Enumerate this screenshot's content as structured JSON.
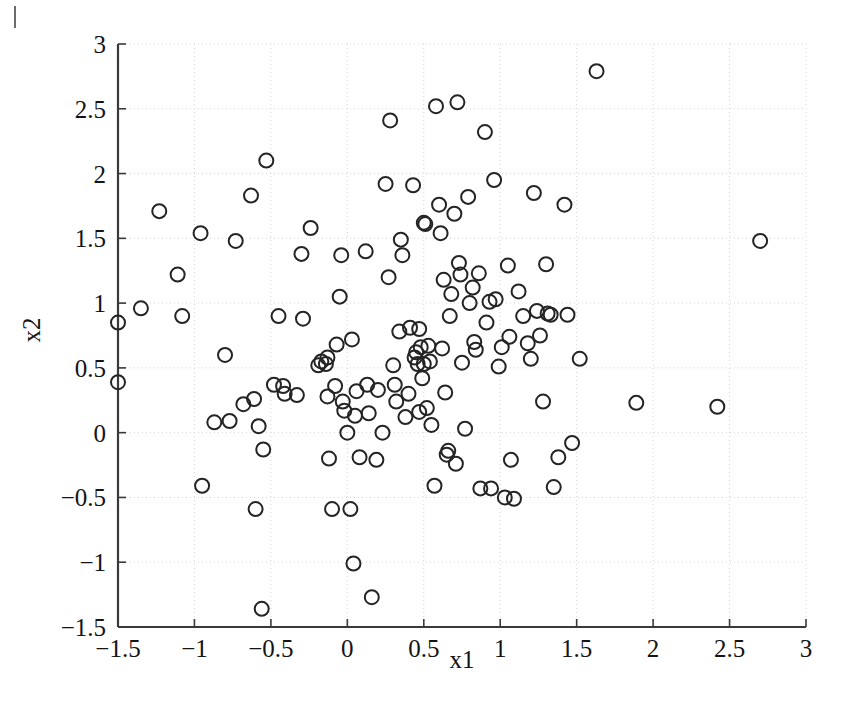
{
  "figure": {
    "kind": "scatter-plot",
    "background_color": "#ffffff",
    "marker_color": "#242424",
    "axis_color": "#3a3a3a",
    "grid_color": "#d6d6d6"
  },
  "chart_data": {
    "type": "scatter",
    "title": "",
    "subtitle": "",
    "xlabel": "x1",
    "ylabel": "x2",
    "xlim": [
      -1.5,
      3
    ],
    "ylim": [
      -1.5,
      3
    ],
    "xticks": [
      -1.5,
      -1,
      -0.5,
      0,
      0.5,
      1,
      1.5,
      2,
      2.5,
      3
    ],
    "yticks": [
      -1.5,
      -1,
      -0.5,
      0,
      0.5,
      1,
      1.5,
      2,
      2.5,
      3
    ],
    "xtick_labels": [
      "-1.5",
      "-1",
      "-0.5",
      "0",
      "0.5",
      "1",
      "1.5",
      "2",
      "2.5",
      "3"
    ],
    "ytick_labels": [
      "-1.5",
      "-1",
      "-0.5",
      "0",
      "0.5",
      "1",
      "1.5",
      "2",
      "2.5",
      "3"
    ],
    "grid": true,
    "grid_style": "dotted",
    "legend": null,
    "legend_position": "none",
    "marker": "open-circle",
    "marker_size": 7,
    "n_points": 139,
    "series": [
      {
        "name": "data",
        "points": [
          [
            -1.5,
            0.85
          ],
          [
            -1.5,
            0.39
          ],
          [
            -1.35,
            0.96
          ],
          [
            -1.23,
            1.71
          ],
          [
            -1.11,
            1.22
          ],
          [
            -1.08,
            0.9
          ],
          [
            -0.96,
            1.54
          ],
          [
            -0.95,
            -0.41
          ],
          [
            -0.87,
            0.08
          ],
          [
            -0.8,
            0.6
          ],
          [
            -0.77,
            0.09
          ],
          [
            -0.73,
            1.48
          ],
          [
            -0.68,
            0.22
          ],
          [
            -0.63,
            1.83
          ],
          [
            -0.61,
            0.26
          ],
          [
            -0.6,
            -0.59
          ],
          [
            -0.58,
            0.05
          ],
          [
            -0.56,
            -1.36
          ],
          [
            -0.55,
            -0.13
          ],
          [
            -0.53,
            2.1
          ],
          [
            -0.48,
            0.37
          ],
          [
            -0.45,
            0.9
          ],
          [
            -0.42,
            0.36
          ],
          [
            -0.41,
            0.3
          ],
          [
            -0.33,
            0.29
          ],
          [
            -0.3,
            1.38
          ],
          [
            -0.29,
            0.88
          ],
          [
            -0.24,
            1.58
          ],
          [
            -0.19,
            0.52
          ],
          [
            -0.17,
            0.55
          ],
          [
            -0.14,
            0.53
          ],
          [
            -0.13,
            0.58
          ],
          [
            -0.13,
            0.28
          ],
          [
            -0.12,
            -0.2
          ],
          [
            -0.1,
            -0.59
          ],
          [
            -0.08,
            0.36
          ],
          [
            -0.07,
            0.68
          ],
          [
            -0.05,
            1.05
          ],
          [
            -0.04,
            1.37
          ],
          [
            -0.03,
            0.24
          ],
          [
            -0.02,
            0.17
          ],
          [
            0.0,
            0.0
          ],
          [
            0.02,
            -0.59
          ],
          [
            0.03,
            0.72
          ],
          [
            0.04,
            -1.01
          ],
          [
            0.05,
            0.13
          ],
          [
            0.06,
            0.32
          ],
          [
            0.08,
            -0.19
          ],
          [
            0.12,
            1.4
          ],
          [
            0.13,
            0.37
          ],
          [
            0.14,
            0.15
          ],
          [
            0.16,
            -1.27
          ],
          [
            0.19,
            -0.21
          ],
          [
            0.2,
            0.33
          ],
          [
            0.23,
            0.0
          ],
          [
            0.25,
            1.92
          ],
          [
            0.27,
            1.2
          ],
          [
            0.28,
            2.41
          ],
          [
            0.3,
            0.52
          ],
          [
            0.31,
            0.37
          ],
          [
            0.32,
            0.24
          ],
          [
            0.34,
            0.78
          ],
          [
            0.35,
            1.49
          ],
          [
            0.36,
            1.37
          ],
          [
            0.38,
            0.12
          ],
          [
            0.4,
            0.3
          ],
          [
            0.41,
            0.81
          ],
          [
            0.43,
            1.91
          ],
          [
            0.44,
            0.58
          ],
          [
            0.45,
            0.62
          ],
          [
            0.46,
            0.53
          ],
          [
            0.47,
            0.8
          ],
          [
            0.47,
            0.16
          ],
          [
            0.48,
            0.66
          ],
          [
            0.49,
            0.42
          ],
          [
            0.5,
            0.53
          ],
          [
            0.5,
            1.62
          ],
          [
            0.51,
            1.61
          ],
          [
            0.52,
            0.19
          ],
          [
            0.53,
            0.67
          ],
          [
            0.54,
            0.55
          ],
          [
            0.55,
            0.06
          ],
          [
            0.57,
            -0.41
          ],
          [
            0.58,
            2.52
          ],
          [
            0.6,
            1.76
          ],
          [
            0.61,
            1.54
          ],
          [
            0.62,
            0.65
          ],
          [
            0.63,
            1.18
          ],
          [
            0.64,
            0.31
          ],
          [
            0.65,
            -0.17
          ],
          [
            0.66,
            -0.14
          ],
          [
            0.67,
            0.9
          ],
          [
            0.68,
            1.07
          ],
          [
            0.7,
            1.69
          ],
          [
            0.71,
            -0.24
          ],
          [
            0.72,
            2.55
          ],
          [
            0.73,
            1.31
          ],
          [
            0.74,
            1.22
          ],
          [
            0.75,
            0.54
          ],
          [
            0.77,
            0.03
          ],
          [
            0.79,
            1.82
          ],
          [
            0.8,
            1.0
          ],
          [
            0.82,
            1.12
          ],
          [
            0.83,
            0.7
          ],
          [
            0.84,
            0.64
          ],
          [
            0.86,
            1.23
          ],
          [
            0.87,
            -0.43
          ],
          [
            0.9,
            2.32
          ],
          [
            0.91,
            0.85
          ],
          [
            0.93,
            1.01
          ],
          [
            0.94,
            -0.43
          ],
          [
            0.96,
            1.95
          ],
          [
            0.97,
            1.03
          ],
          [
            0.99,
            0.51
          ],
          [
            1.01,
            0.66
          ],
          [
            1.03,
            -0.5
          ],
          [
            1.05,
            1.29
          ],
          [
            1.06,
            0.74
          ],
          [
            1.07,
            -0.21
          ],
          [
            1.09,
            -0.51
          ],
          [
            1.12,
            1.09
          ],
          [
            1.15,
            0.9
          ],
          [
            1.18,
            0.69
          ],
          [
            1.2,
            0.57
          ],
          [
            1.22,
            1.85
          ],
          [
            1.24,
            0.94
          ],
          [
            1.26,
            0.75
          ],
          [
            1.28,
            0.24
          ],
          [
            1.3,
            1.3
          ],
          [
            1.31,
            0.92
          ],
          [
            1.33,
            0.91
          ],
          [
            1.35,
            -0.42
          ],
          [
            1.38,
            -0.19
          ],
          [
            1.42,
            1.76
          ],
          [
            1.44,
            0.91
          ],
          [
            1.47,
            -0.08
          ],
          [
            1.52,
            0.57
          ],
          [
            1.63,
            2.79
          ],
          [
            1.89,
            0.23
          ],
          [
            2.42,
            0.2
          ],
          [
            2.7,
            1.48
          ]
        ]
      }
    ]
  },
  "axes": {
    "x_axis_label": "x1",
    "y_axis_label": "x2"
  }
}
